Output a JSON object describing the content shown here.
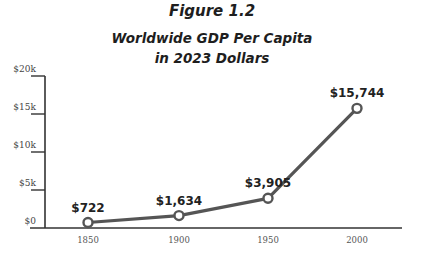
{
  "figure": {
    "label": "Figure 1.2",
    "title_line1": "Worldwide GDP Per Capita",
    "title_line2": "in 2023 Dollars"
  },
  "colors": {
    "line": "#555555",
    "marker_fill": "#ffffff",
    "axis": "#333333"
  },
  "chart_data": {
    "type": "line",
    "xlabel": "",
    "ylabel": "",
    "categories": [
      "1850",
      "1900",
      "1950",
      "2000"
    ],
    "values": [
      722,
      1634,
      3905,
      15744
    ],
    "data_labels": [
      "$722",
      "$1,634",
      "$3,905",
      "$15,744"
    ],
    "ylim": [
      0,
      20000
    ],
    "yticks": [
      0,
      5000,
      10000,
      15000,
      20000
    ],
    "ytick_labels": [
      "$0",
      "$5k",
      "$10k",
      "$15k",
      "$20k"
    ],
    "grid": false,
    "legend": null
  }
}
